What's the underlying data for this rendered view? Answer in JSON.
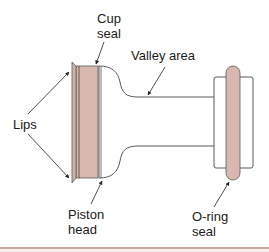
{
  "labels": {
    "cup_seal": {
      "line1": "Cup",
      "line2": "seal"
    },
    "valley_area": {
      "line1": "Valley area"
    },
    "lips": {
      "line1": "Lips"
    },
    "piston_head": {
      "line1": "Piston",
      "line2": "head"
    },
    "o_ring_seal": {
      "line1": "O-ring",
      "line2": "seal"
    }
  },
  "colors": {
    "seal_fill": "#d6b8ae",
    "outline": "#5a5a5a",
    "seal_stripe": "#6b5550",
    "body_fill": "#ffffff",
    "rule": "#c9a8a0"
  }
}
